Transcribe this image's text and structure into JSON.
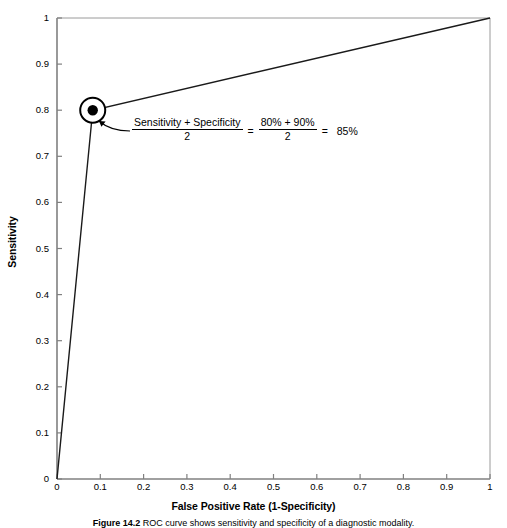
{
  "chart_data": {
    "type": "line",
    "title": "",
    "xlabel": "False Positive Rate (1-Specificity)",
    "ylabel": "Sensitivity",
    "xlim": [
      0,
      1
    ],
    "ylim": [
      0,
      1
    ],
    "grid": false,
    "legend": "none",
    "x_ticks": [
      "0",
      "0.1",
      "0.2",
      "0.3",
      "0.4",
      "0.5",
      "0.6",
      "0.7",
      "0.8",
      "0.9",
      "1"
    ],
    "y_ticks": [
      "0",
      "0.1",
      "0.2",
      "0.3",
      "0.4",
      "0.5",
      "0.6",
      "0.7",
      "0.8",
      "0.9",
      "1"
    ],
    "x_tick_values": [
      0,
      0.1,
      0.2,
      0.3,
      0.4,
      0.5,
      0.6,
      0.7,
      0.8,
      0.9,
      1
    ],
    "y_tick_values": [
      0,
      0.1,
      0.2,
      0.3,
      0.4,
      0.5,
      0.6,
      0.7,
      0.8,
      0.9,
      1
    ],
    "series": [
      {
        "name": "ROC curve",
        "x": [
          0,
          0.0825,
          1
        ],
        "y": [
          0,
          0.8,
          1
        ]
      }
    ],
    "markers": [
      {
        "name": "optimal-cutoff",
        "x": 0.0825,
        "y": 0.8,
        "style": "filled-dot-in-open-circle"
      }
    ],
    "line_color": "#1a1a1a",
    "axis_color": "#6e6e6e",
    "background": "#ffffff"
  },
  "axes": {
    "x_title": "False Positive Rate (1-Specificity)",
    "y_title": "Sensitivity"
  },
  "annotation": {
    "left_numerator": "Sensitivity + Specificity",
    "left_denominator": "2",
    "equals_1": "=",
    "right_numerator": "80% + 90%",
    "right_denominator": "2",
    "equals_2": "=",
    "result": "85%"
  },
  "caption": {
    "label": "Figure 14.2",
    "text": "ROC curve shows sensitivity and specificity of a diagnostic modality."
  }
}
